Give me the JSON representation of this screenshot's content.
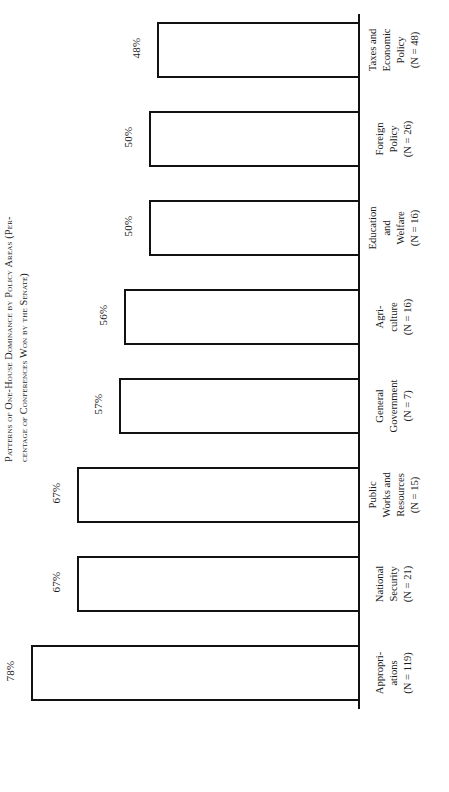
{
  "figure": {
    "caption_prefix": "Figure 3.",
    "caption_line1": "Patterns of One-House Dominance by Policy Areas (Per-",
    "caption_line2": "centage of Conferences Won by the Senate)",
    "caption_full": "FIGURE 3. PATTERNS OF ONE-HOUSE DOMINANCE BY POLICY AREAS (PERCENTAGE OF CONFERENCES WON BY THE SENATE)"
  },
  "chart_data": {
    "type": "bar",
    "orientation": "horizontal",
    "xlabel": "",
    "ylabel": "",
    "xlim": [
      0,
      100
    ],
    "grid": false,
    "legend": "none",
    "value_suffix": "%",
    "categories": [
      "Appropriations",
      "National Security",
      "Public Works and Resources",
      "General Government",
      "Agriculture",
      "Education and Welfare",
      "Foreign Policy",
      "Taxes and Economic Policy"
    ],
    "values": [
      78,
      67,
      67,
      57,
      56,
      50,
      50,
      48
    ],
    "n_values": [
      119,
      21,
      15,
      7,
      16,
      16,
      26,
      48
    ],
    "bars": [
      {
        "category": "Appropriations",
        "value": 78,
        "value_label": "78%",
        "n_label": "(N = 119)",
        "label_line1": "Appropri-",
        "label_line2": "ations",
        "label_line3": "(N = 119)",
        "label_line4": ""
      },
      {
        "category": "National Security",
        "value": 67,
        "value_label": "67%",
        "n_label": "(N = 21)",
        "label_line1": "National",
        "label_line2": "Security",
        "label_line3": "(N = 21)",
        "label_line4": ""
      },
      {
        "category": "Public Works and Resources",
        "value": 67,
        "value_label": "67%",
        "n_label": "(N = 15)",
        "label_line1": "Public",
        "label_line2": "Works and",
        "label_line3": "Resources",
        "label_line4": "(N = 15)"
      },
      {
        "category": "General Government",
        "value": 57,
        "value_label": "57%",
        "n_label": "(N = 7)",
        "label_line1": "General",
        "label_line2": "Government",
        "label_line3": "(N = 7)",
        "label_line4": ""
      },
      {
        "category": "Agriculture",
        "value": 56,
        "value_label": "56%",
        "n_label": "(N = 16)",
        "label_line1": "Agri-",
        "label_line2": "culture",
        "label_line3": "(N = 16)",
        "label_line4": ""
      },
      {
        "category": "Education and Welfare",
        "value": 50,
        "value_label": "50%",
        "n_label": "(N = 16)",
        "label_line1": "Education",
        "label_line2": "and",
        "label_line3": "Welfare",
        "label_line4": "(N = 16)"
      },
      {
        "category": "Foreign Policy",
        "value": 50,
        "value_label": "50%",
        "n_label": "(N = 26)",
        "label_line1": "Foreign",
        "label_line2": "Policy",
        "label_line3": "(N = 26)",
        "label_line4": ""
      },
      {
        "category": "Taxes and Economic Policy",
        "value": 48,
        "value_label": "48%",
        "n_label": "(N = 48)",
        "label_line1": "Taxes and",
        "label_line2": "Economic",
        "label_line3": "Policy",
        "label_line4": "(N = 48)"
      }
    ]
  },
  "style": {
    "bar_fill": "#ffffff",
    "bar_stroke": "#121212",
    "axis_color": "#111111",
    "text_color": "#1b1b1b",
    "page_background": "#ffffff"
  }
}
